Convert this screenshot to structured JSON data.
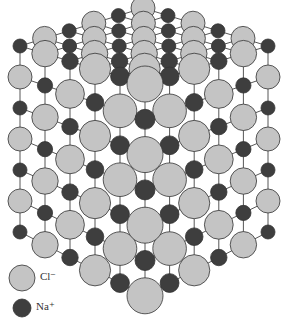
{
  "diagram": {
    "grid": {
      "nx": 5,
      "ny": 5,
      "nz": 6
    },
    "projection": {
      "front_corner": [
        145,
        84
      ],
      "left_axis": [
        -25,
        -7.6
      ],
      "right_axis": [
        24.6,
        -7.6
      ],
      "down_front": 35.3,
      "down_back": 31
    },
    "colors": {
      "cl_fill": "#c4c4c4",
      "na_fill": "#3e3e3e",
      "stroke": "#333333",
      "bond": "#444444"
    },
    "radii": {
      "cl_front": 18,
      "cl_back": 12,
      "na_front": 10,
      "na_back": 7
    }
  },
  "legend": {
    "items": [
      {
        "ion": "Cl",
        "charge": "−",
        "label": "Cl⁻",
        "color": "#c4c4c4",
        "x": 22,
        "y": 278,
        "r": 13
      },
      {
        "ion": "Na",
        "charge": "+",
        "label": "Na⁺",
        "color": "#3e3e3e",
        "x": 22,
        "y": 308,
        "r": 9
      }
    ]
  }
}
